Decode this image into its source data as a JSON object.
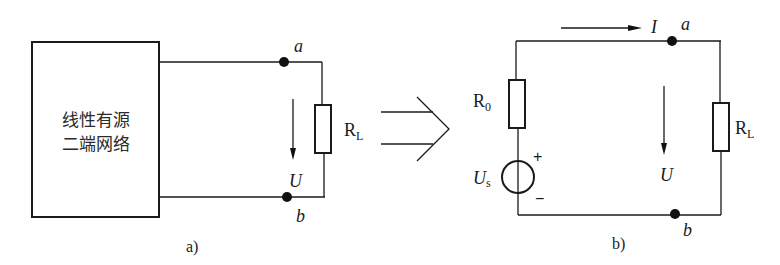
{
  "figure_a": {
    "caption": "a)",
    "network_box": {
      "line1": "线性有源",
      "line2": "二端网络"
    },
    "terminal_a": "a",
    "terminal_b": "b",
    "voltage_label": "U",
    "load_resistor": {
      "main": "R",
      "sub": "L"
    }
  },
  "equivalence_arrow": {
    "icon": "double-arrow-right-icon"
  },
  "figure_b": {
    "caption": "b)",
    "current_label": "I",
    "terminal_a": "a",
    "terminal_b": "b",
    "voltage_label": "U",
    "source_resistor": {
      "main": "R",
      "sub": "0"
    },
    "voltage_source": {
      "main": "U",
      "sub": "s",
      "plus": "+",
      "minus": "−"
    },
    "load_resistor": {
      "main": "R",
      "sub": "L"
    }
  }
}
